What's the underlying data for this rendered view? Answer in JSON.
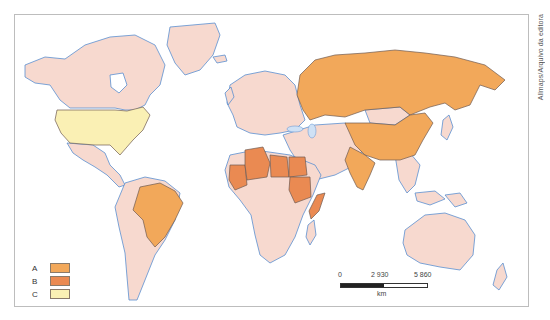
{
  "map": {
    "credit": "Allmaps/Arquivo da editora",
    "colors": {
      "A": "#f2a85a",
      "B": "#ea8a52",
      "C": "#faf0b4",
      "other": "#f7d9cf",
      "border": "#6e5a52",
      "coast": "#5b8fd0",
      "water": "#ffffff"
    },
    "legend": [
      {
        "key": "A",
        "label": "A",
        "color": "#f2a85a"
      },
      {
        "key": "B",
        "label": "B",
        "color": "#ea8a52"
      },
      {
        "key": "C",
        "label": "C",
        "color": "#faf0b4"
      }
    ],
    "scale": {
      "ticks": [
        "0",
        "2 930",
        "5 860"
      ],
      "unit": "km"
    },
    "highlighted": {
      "A": [
        "Russia",
        "China",
        "India",
        "Brazil"
      ],
      "B": [
        "Mauritania",
        "Algeria",
        "Libya",
        "Egypt",
        "Sudan",
        "Somalia"
      ],
      "C": [
        "United States"
      ]
    }
  }
}
